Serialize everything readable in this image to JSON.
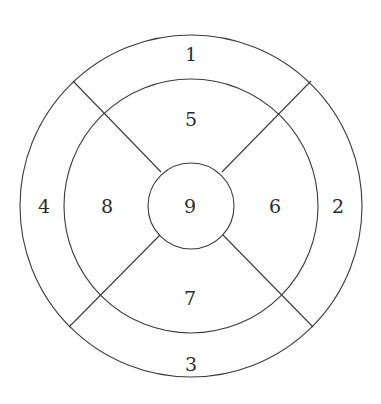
{
  "diagram": {
    "type": "segmented-concentric-circles",
    "center": {
      "x": 191,
      "y": 206
    },
    "stroke_color": "#3a3a3a",
    "circles": [
      {
        "name": "outer",
        "r": 171
      },
      {
        "name": "middle",
        "r": 127
      },
      {
        "name": "inner",
        "r": 43
      }
    ],
    "dividers": [
      {
        "name": "top-left",
        "x1": 73,
        "y1": 81,
        "x2": 161,
        "y2": 172
      },
      {
        "name": "top-right",
        "x1": 311,
        "y1": 81,
        "x2": 222,
        "y2": 172
      },
      {
        "name": "bottom-left",
        "x1": 69,
        "y1": 327,
        "x2": 160,
        "y2": 235
      },
      {
        "name": "bottom-right",
        "x1": 313,
        "y1": 327,
        "x2": 223,
        "y2": 235
      }
    ],
    "segments": [
      {
        "label": "1",
        "ring": "outer",
        "position": "top",
        "x": 191,
        "y": 54
      },
      {
        "label": "2",
        "ring": "outer",
        "position": "right",
        "x": 338,
        "y": 206
      },
      {
        "label": "3",
        "ring": "outer",
        "position": "bottom",
        "x": 191,
        "y": 364
      },
      {
        "label": "4",
        "ring": "outer",
        "position": "left",
        "x": 44,
        "y": 206
      },
      {
        "label": "5",
        "ring": "middle",
        "position": "top",
        "x": 191,
        "y": 119
      },
      {
        "label": "6",
        "ring": "middle",
        "position": "right",
        "x": 275,
        "y": 206
      },
      {
        "label": "7",
        "ring": "middle",
        "position": "bottom",
        "x": 190,
        "y": 298
      },
      {
        "label": "8",
        "ring": "middle",
        "position": "left",
        "x": 107,
        "y": 206
      },
      {
        "label": "9",
        "ring": "inner",
        "position": "center",
        "x": 190,
        "y": 206
      }
    ]
  }
}
